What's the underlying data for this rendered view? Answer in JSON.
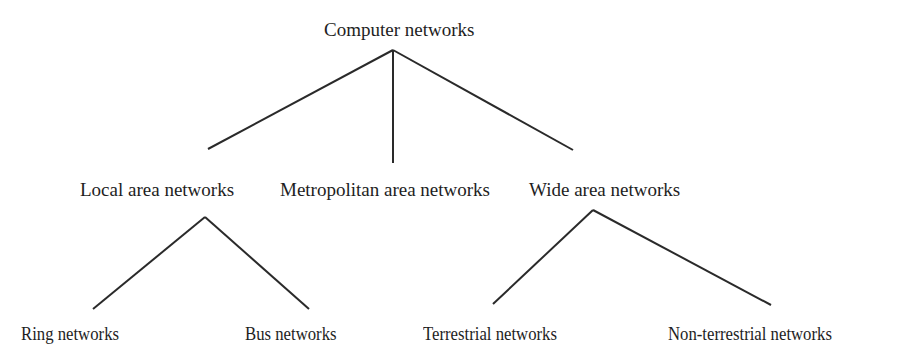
{
  "diagram": {
    "type": "tree",
    "root": {
      "label": "Computer networks",
      "children": [
        {
          "label": "Local area networks",
          "children": [
            {
              "label": "Ring networks"
            },
            {
              "label": "Bus networks"
            }
          ]
        },
        {
          "label": "Metropolitan area networks",
          "children": []
        },
        {
          "label": "Wide area networks",
          "children": [
            {
              "label": "Terrestrial networks"
            },
            {
              "label": "Non-terrestrial networks"
            }
          ]
        }
      ]
    },
    "colors": {
      "line": "#2a2a2a",
      "text": "#1e1e1e",
      "background": "#ffffff"
    }
  }
}
